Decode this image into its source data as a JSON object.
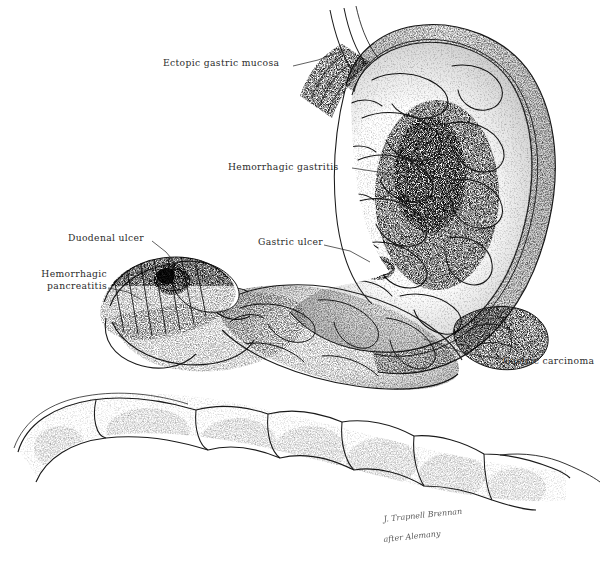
{
  "figure": {
    "medium": "pen-and-ink stipple drawing",
    "background_color": "#ffffff",
    "ink_color": "#1a1a1a",
    "label_color": "#2b2b2b",
    "width": 615,
    "height": 573
  },
  "labels": [
    {
      "id": "ectopic-gastric-mucosa",
      "text": "Ectopic gastric mucosa",
      "x": 163,
      "y": 57,
      "align": "left",
      "leader": "M 293 66 L 318 60 L 345 50"
    },
    {
      "id": "hemorrhagic-gastritis",
      "text": "Hemorrhagic gastritis",
      "x": 228,
      "y": 161,
      "align": "left",
      "leader": "M 352 168 L 385 173 L 414 186"
    },
    {
      "id": "duodenal-ulcer",
      "text": "Duodenal ulcer",
      "x": 68,
      "y": 232,
      "align": "left",
      "leader": "M 152 241 L 166 252 L 176 264"
    },
    {
      "id": "hemorrhagic-pancreatitis",
      "text": "Hemorrhagic\npancreatitis",
      "x": 27,
      "y": 268,
      "align": "left",
      "leader": "M 108 288 L 128 292 L 142 300"
    },
    {
      "id": "gastric-ulcer",
      "text": "Gastric ulcer",
      "x": 258,
      "y": 236,
      "align": "left",
      "leader": "M 324 245 L 350 251 L 370 262"
    },
    {
      "id": "gastric-carcinoma",
      "text": "Gastric carcinoma",
      "x": 503,
      "y": 355,
      "align": "left",
      "leader": "M 500 359 L 465 353 L 424 339"
    }
  ],
  "signature": {
    "line1": "J. Trapnell Brennan",
    "line2": "after Alemany",
    "x": 372,
    "y": 506
  },
  "anatomy": {
    "structures": [
      {
        "id": "esophagus",
        "name": "Esophagus / cardia"
      },
      {
        "id": "stomach-fundus",
        "name": "Gastric fundus"
      },
      {
        "id": "stomach-body",
        "name": "Gastric body with rugal folds"
      },
      {
        "id": "greater-curvature",
        "name": "Greater curvature"
      },
      {
        "id": "lesser-curvature",
        "name": "Lesser curvature"
      },
      {
        "id": "pylorus",
        "name": "Pylorus"
      },
      {
        "id": "duodenum",
        "name": "Duodenal bulb"
      },
      {
        "id": "pancreas",
        "name": "Pancreas"
      },
      {
        "id": "transverse-colon",
        "name": "Transverse colon with haustra"
      }
    ]
  }
}
